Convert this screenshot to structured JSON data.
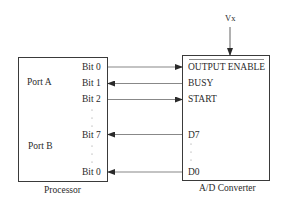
{
  "processor": {
    "label": "Processor",
    "ports": [
      {
        "name": "Port A"
      },
      {
        "name": "Port B"
      }
    ],
    "bits": [
      {
        "label": "Bit 0",
        "port": "Port A"
      },
      {
        "label": "Bit 1",
        "port": "Port A"
      },
      {
        "label": "Bit 2",
        "port": "Port A"
      },
      {
        "label": "Bit 7",
        "port": "Port B"
      },
      {
        "label": "Bit 0",
        "port": "Port B"
      }
    ]
  },
  "converter": {
    "label": "A/D Converter",
    "supply": "Vx",
    "pins": [
      {
        "label": "OUTPUT ENABLE",
        "overline": true
      },
      {
        "label": "BUSY"
      },
      {
        "label": "START"
      },
      {
        "label": "D7"
      },
      {
        "label": "D0"
      }
    ]
  },
  "connections": [
    {
      "from": "Port A Bit 0",
      "to": "OUTPUT ENABLE",
      "direction": "to-converter"
    },
    {
      "from": "BUSY",
      "to": "Port A Bit 1",
      "direction": "to-processor"
    },
    {
      "from": "Port A Bit 2",
      "to": "START",
      "direction": "to-converter"
    },
    {
      "from": "D7",
      "to": "Port B Bit 7",
      "direction": "to-processor"
    },
    {
      "from": "D0",
      "to": "Port B Bit 0",
      "direction": "to-processor"
    }
  ],
  "colors": {
    "line": "#3a3a3a",
    "text": "#2a2a2a"
  }
}
